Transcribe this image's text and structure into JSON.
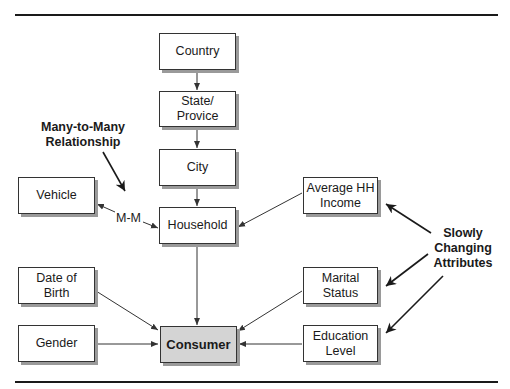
{
  "diagram": {
    "nodes": {
      "country": "Country",
      "state": "State/\nProvice",
      "city": "City",
      "household": "Household",
      "vehicle": "Vehicle",
      "avg_income": "Average HH\nIncome",
      "dob": "Date of\nBirth",
      "marital": "Marital\nStatus",
      "gender": "Gender",
      "consumer": "Consumer",
      "education": "Education\nLevel"
    },
    "annotations": {
      "many_to_many": "Many-to-Many\nRelationship",
      "mm_edge": "M-M",
      "slowly_changing": "Slowly\nChanging\nAttributes"
    },
    "edges": [
      {
        "from": "country",
        "to": "state"
      },
      {
        "from": "state",
        "to": "city"
      },
      {
        "from": "city",
        "to": "household"
      },
      {
        "from": "household",
        "to": "consumer"
      },
      {
        "from": "avg_income",
        "to": "household"
      },
      {
        "from": "household",
        "to": "vehicle",
        "label": "M-M",
        "bidirectional": true
      },
      {
        "from": "dob",
        "to": "consumer"
      },
      {
        "from": "gender",
        "to": "consumer"
      },
      {
        "from": "marital",
        "to": "consumer"
      },
      {
        "from": "education",
        "to": "consumer"
      }
    ],
    "colors": {
      "consumer_fill": "#d4d4d4",
      "box_fill": "#ffffff",
      "shadow": "#9a9a9a",
      "line": "#333333"
    }
  }
}
